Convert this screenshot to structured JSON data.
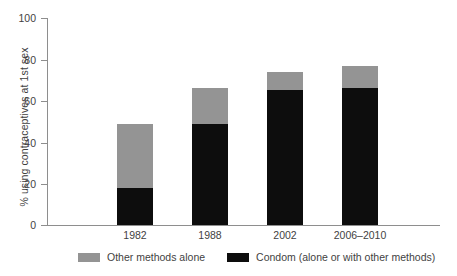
{
  "chart_data": {
    "type": "bar",
    "subtype": "stacked-vertical",
    "title": "",
    "xlabel": "",
    "ylabel": "% using contraceptives at 1st sex",
    "ylim": [
      0,
      100
    ],
    "yticks": [
      0,
      20,
      40,
      60,
      80,
      100
    ],
    "grid": false,
    "legend_position": "bottom",
    "categories": [
      "1982",
      "1988",
      "2002",
      "2006–2010"
    ],
    "series": [
      {
        "name": "Condom (alone or with other methods)",
        "color": "#0d0d0d",
        "values": [
          18,
          49,
          65,
          66
        ]
      },
      {
        "name": "Other methods alone",
        "color": "#949494",
        "values": [
          31,
          17,
          9,
          11
        ]
      }
    ],
    "totals": [
      49,
      66,
      74,
      77
    ]
  },
  "axis": {
    "y_title": "% using contraceptives at 1st sex",
    "y_ticks": [
      "100",
      "80",
      "60",
      "40",
      "20",
      "0"
    ],
    "x_ticks": [
      "1982",
      "1988",
      "2002",
      "2006–2010"
    ]
  },
  "legend": {
    "items": [
      {
        "label": "Other methods alone",
        "color": "#949494"
      },
      {
        "label": "Condom (alone or with other methods)",
        "color": "#0d0d0d"
      }
    ]
  },
  "caption": {
    "remnant": ""
  }
}
